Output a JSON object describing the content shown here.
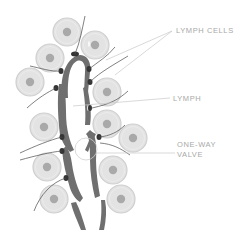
{
  "labels": {
    "lymph_cells": "LYMPH CELLS",
    "lymph": "LYMPH",
    "valve_line1": "ONE-WAY",
    "valve_line2": "VALVE"
  },
  "colors": {
    "cell_outer": "#e3e3e3",
    "cell_ring": "#cfcfcf",
    "cell_nucleus": "#a9a9a9",
    "vessel": "#6f6f6f",
    "vessel_dark": "#3a3a3a",
    "thread": "#4a4a4a",
    "leader_line": "#c8c8c8",
    "label_text": "#a8a8a8"
  },
  "cells": [
    {
      "cx": 67,
      "cy": 32,
      "r": 14
    },
    {
      "cx": 95,
      "cy": 45,
      "r": 14
    },
    {
      "cx": 50,
      "cy": 58,
      "r": 14
    },
    {
      "cx": 30,
      "cy": 82,
      "r": 14
    },
    {
      "cx": 107,
      "cy": 92,
      "r": 14
    },
    {
      "cx": 44,
      "cy": 127,
      "r": 14
    },
    {
      "cx": 107,
      "cy": 124,
      "r": 14
    },
    {
      "cx": 133,
      "cy": 138,
      "r": 14
    },
    {
      "cx": 47,
      "cy": 167,
      "r": 14
    },
    {
      "cx": 113,
      "cy": 170,
      "r": 14
    },
    {
      "cx": 54,
      "cy": 199,
      "r": 14
    },
    {
      "cx": 121,
      "cy": 199,
      "r": 14
    }
  ]
}
